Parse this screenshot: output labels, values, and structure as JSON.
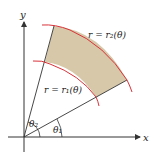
{
  "diagram": {
    "axes": {
      "x_label": "x",
      "y_label": "y"
    },
    "curves": [
      {
        "id": "outer",
        "label": "r = r₂(θ)"
      },
      {
        "id": "inner",
        "label": "r = r₁(θ)"
      }
    ],
    "angles": [
      {
        "id": "theta1",
        "label": "θ₁"
      },
      {
        "id": "theta2",
        "label": "θ₂"
      }
    ],
    "colors": {
      "region_fill": "#d6c8a8",
      "curve": "#d9333a",
      "axis": "#333333",
      "ray": "#333333"
    }
  }
}
